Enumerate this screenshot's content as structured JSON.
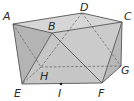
{
  "diagram": {
    "type": "3d-polyhedron",
    "colors": {
      "face_light": "#d4d4d4",
      "face_mid": "#c2c2c2",
      "face_dark": "#a9a9a9",
      "edge": "#555555",
      "hidden_edge": "#6a6a6a",
      "label": "#2a2a2a"
    },
    "vertices": [
      {
        "id": "A",
        "label": "A",
        "x": 13,
        "y": 24,
        "lx": 3,
        "ly": 11
      },
      {
        "id": "B",
        "label": "B",
        "x": 52,
        "y": 33,
        "lx": 48,
        "ly": 21
      },
      {
        "id": "C",
        "label": "C",
        "x": 122,
        "y": 22,
        "lx": 124,
        "ly": 11
      },
      {
        "id": "D",
        "label": "D",
        "x": 82,
        "y": 13,
        "lx": 80,
        "ly": 2
      },
      {
        "id": "E",
        "label": "E",
        "x": 22,
        "y": 84,
        "lx": 14,
        "ly": 88
      },
      {
        "id": "F",
        "label": "F",
        "x": 102,
        "y": 83,
        "lx": 98,
        "ly": 88
      },
      {
        "id": "G",
        "label": "G",
        "x": 121,
        "y": 66,
        "lx": 121,
        "ly": 65
      },
      {
        "id": "H",
        "label": "H",
        "x": 41,
        "y": 67,
        "lx": 40,
        "ly": 71
      },
      {
        "id": "I",
        "label": "I",
        "x": 61,
        "y": 84,
        "lx": 58,
        "ly": 88
      }
    ],
    "visible_edges": [
      [
        "A",
        "B"
      ],
      [
        "B",
        "C"
      ],
      [
        "A",
        "D"
      ],
      [
        "D",
        "C"
      ],
      [
        "A",
        "E"
      ],
      [
        "E",
        "F"
      ],
      [
        "F",
        "G"
      ],
      [
        "G",
        "C"
      ],
      [
        "B",
        "E"
      ],
      [
        "B",
        "F"
      ],
      [
        "C",
        "F"
      ]
    ],
    "hidden_edges": [
      [
        "D",
        "H"
      ],
      [
        "H",
        "E"
      ],
      [
        "H",
        "G"
      ],
      [
        "A",
        "H"
      ],
      [
        "D",
        "G"
      ],
      [
        "D",
        "E"
      ]
    ],
    "points": [
      {
        "id": "I",
        "x": 61,
        "y": 84
      }
    ]
  }
}
